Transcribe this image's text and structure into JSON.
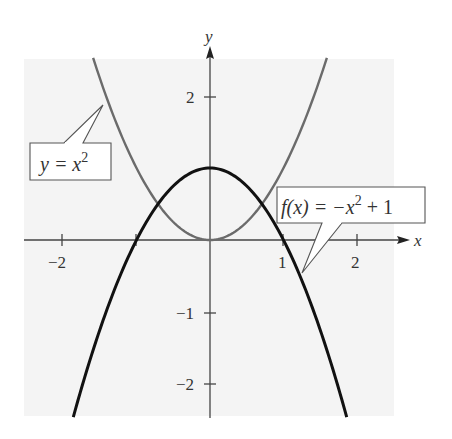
{
  "chart_data": {
    "type": "line",
    "title": "",
    "xlabel": "x",
    "ylabel": "y",
    "xlim": [
      -2.5,
      2.6
    ],
    "ylim": [
      -2.5,
      2.6
    ],
    "grid": false,
    "x_ticks": [
      -2,
      -1,
      1,
      2
    ],
    "x_tick_labels": [
      "−2",
      "",
      "1",
      "2"
    ],
    "y_ticks": [
      -2,
      -1,
      2
    ],
    "y_tick_labels": [
      "−2",
      "−1",
      "2"
    ],
    "series": [
      {
        "name": "y = x^2",
        "label_text": "y = x",
        "label_sup": "2",
        "color": "#6b6b6b",
        "expression": "x^2",
        "x_range": [
          -1.59,
          1.59
        ],
        "x": [
          -1.59,
          -1.5,
          -1.25,
          -1.0,
          -0.75,
          -0.5,
          -0.25,
          0,
          0.25,
          0.5,
          0.75,
          1.0,
          1.25,
          1.5,
          1.59
        ],
        "values": [
          2.53,
          2.25,
          1.5625,
          1.0,
          0.5625,
          0.25,
          0.0625,
          0,
          0.0625,
          0.25,
          0.5625,
          1.0,
          1.5625,
          2.25,
          2.53
        ]
      },
      {
        "name": "f(x) = -x^2 + 1",
        "label_text_a": "f(x) =  −x",
        "label_sup": "2",
        "label_text_b": " + 1",
        "color": "#111111",
        "expression": "-x^2+1",
        "x_range": [
          -1.86,
          1.86
        ],
        "x": [
          -1.86,
          -1.5,
          -1.25,
          -1.0,
          -0.75,
          -0.5,
          -0.25,
          0,
          0.25,
          0.5,
          0.75,
          1.0,
          1.25,
          1.5,
          1.86
        ],
        "values": [
          -2.46,
          -1.25,
          -0.5625,
          0,
          0.4375,
          0.75,
          0.9375,
          1,
          0.9375,
          0.75,
          0.4375,
          0,
          -0.5625,
          -1.25,
          -2.46
        ]
      }
    ],
    "annotations": [
      {
        "text": "y = x^2",
        "points_to": "y = x^2 curve (upper left)"
      },
      {
        "text": "f(x) = -x^2 + 1",
        "points_to": "f(x) curve (right side, below x-axis)"
      }
    ],
    "intersections": [
      [
        -0.707,
        0.5
      ],
      [
        0.707,
        0.5
      ]
    ],
    "legend_position": "callouts"
  },
  "labels": {
    "x_axis": "x",
    "y_axis": "y",
    "tick_x_neg2": "−2",
    "tick_x_1": "1",
    "tick_x_2": "2",
    "tick_y_2": "2",
    "tick_y_neg1": "−1",
    "tick_y_neg2": "−2",
    "callout_square_base": "y = x",
    "callout_square_sup": "2",
    "callout_f_a": "f(x) =  −x",
    "callout_f_sup": "2",
    "callout_f_b": " + 1"
  },
  "colors": {
    "background_panel": "#f4f4f4",
    "axis": "#444444",
    "square_curve": "#6b6b6b",
    "f_curve": "#111111",
    "callout_border": "#555555",
    "callout_fill": "#ffffff"
  }
}
